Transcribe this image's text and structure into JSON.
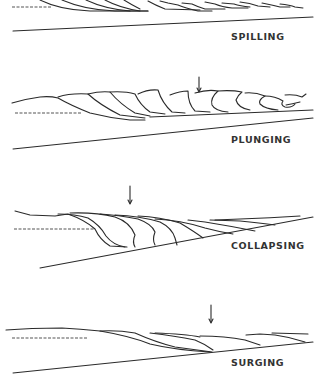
{
  "diagram": {
    "type": "breaker-types",
    "panels": [
      {
        "id": "spilling",
        "label": "SPILLING",
        "has_arrow": false
      },
      {
        "id": "plunging",
        "label": "PLUNGING",
        "has_arrow": true
      },
      {
        "id": "collapsing",
        "label": "COLLAPSING",
        "has_arrow": true
      },
      {
        "id": "surging",
        "label": "SURGING",
        "has_arrow": true
      }
    ],
    "colors": {
      "line": "#2a2a2a",
      "background": "#ffffff",
      "label": "#333333"
    }
  }
}
